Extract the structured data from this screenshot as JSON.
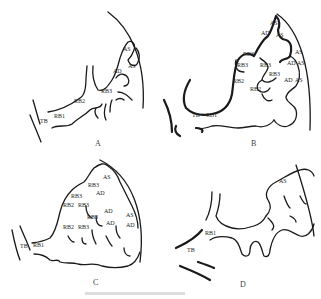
{
  "figure": {
    "panels": [
      {
        "id": "A",
        "caption": "A",
        "labels": [
          "TB",
          "RB1",
          "RB2",
          "RB3",
          "AD",
          "AS",
          "AS"
        ]
      },
      {
        "id": "B",
        "caption": "B",
        "labels": [
          "AS",
          "AD",
          "AS",
          "RB3",
          "RB3",
          "RB3",
          "RB3",
          "RB2",
          "RB2",
          "AS",
          "AD",
          "AS",
          "AD",
          "AS",
          "TB",
          "RB1"
        ]
      },
      {
        "id": "C",
        "caption": "C",
        "labels": [
          "AS",
          "RB3",
          "AD",
          "RB3",
          "RB2",
          "RB3",
          "AD",
          "RB3",
          "RB2",
          "RB3",
          "AD",
          "AS",
          "AD",
          "TB",
          "RB1"
        ]
      },
      {
        "id": "D",
        "caption": "D",
        "labels": [
          "AS",
          "RB1",
          "TB"
        ]
      }
    ]
  },
  "colors": {
    "stroke": "#1a1a1a",
    "text": "#222222",
    "background": "#ffffff"
  }
}
